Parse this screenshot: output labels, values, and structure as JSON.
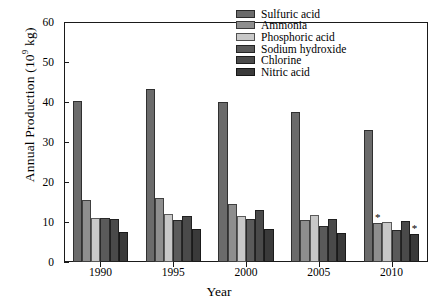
{
  "chart_data": {
    "type": "bar",
    "title": "",
    "xlabel": "Year",
    "ylabel": "Annual Production (10^9 kg)",
    "ylabel_prefix": "Annual Production (10",
    "ylabel_exponent": "9",
    "ylabel_suffix": " kg)",
    "categories": [
      "1990",
      "1995",
      "2000",
      "2005",
      "2010"
    ],
    "ylim": [
      0,
      60
    ],
    "yticks": [
      0,
      10,
      20,
      30,
      40,
      50,
      60
    ],
    "grid": false,
    "legend_position": "top-right inside plot",
    "series": [
      {
        "name": "Sulfuric acid",
        "color": "#6b6b6b",
        "values": [
          40.3,
          43.3,
          39.9,
          37.6,
          33.0
        ]
      },
      {
        "name": "Ammonia",
        "color": "#8e8e8e",
        "values": [
          15.4,
          15.9,
          14.6,
          10.4,
          9.8
        ]
      },
      {
        "name": "Phosphoric acid",
        "color": "#c8c8c8",
        "values": [
          11.0,
          12.1,
          11.5,
          11.8,
          9.9
        ]
      },
      {
        "name": "Sodium hydroxide",
        "color": "#5a5a5a",
        "values": [
          11.1,
          10.5,
          10.7,
          9.1,
          8.1
        ]
      },
      {
        "name": "Chlorine",
        "color": "#4a4a4a",
        "values": [
          10.8,
          11.4,
          13.0,
          10.7,
          10.3
        ]
      },
      {
        "name": "Nitric acid",
        "color": "#3a3a3a",
        "values": [
          7.5,
          8.3,
          8.3,
          7.2,
          6.9
        ]
      }
    ],
    "annotations": [
      {
        "symbol": "*",
        "category": "2010",
        "series": "Ammonia"
      },
      {
        "symbol": "*",
        "category": "2010",
        "series": "Nitric acid"
      }
    ]
  }
}
